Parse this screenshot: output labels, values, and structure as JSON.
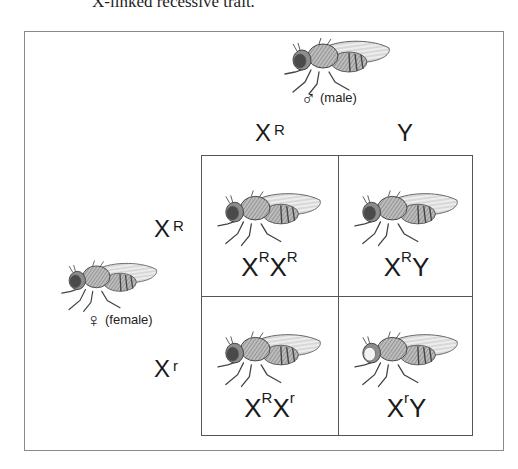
{
  "caption": "X-linked recessive trait.",
  "male_parent": {
    "symbol": "♂",
    "label": "(male)",
    "eye_color": "red"
  },
  "female_parent": {
    "symbol": "♀",
    "label": "(female)",
    "eye_color": "red"
  },
  "male_gametes": [
    {
      "base": "X",
      "sup": "R"
    },
    {
      "base": "Y",
      "sup": ""
    }
  ],
  "female_gametes": [
    {
      "base": "X",
      "sup": "R"
    },
    {
      "base": "X",
      "sup": "r"
    }
  ],
  "offspring": [
    {
      "parts": [
        {
          "base": "X",
          "sup": "R"
        },
        {
          "base": "X",
          "sup": "R"
        }
      ],
      "eye_color": "red"
    },
    {
      "parts": [
        {
          "base": "X",
          "sup": "R"
        },
        {
          "base": "Y",
          "sup": ""
        }
      ],
      "eye_color": "red"
    },
    {
      "parts": [
        {
          "base": "X",
          "sup": "R"
        },
        {
          "base": "X",
          "sup": "r"
        }
      ],
      "eye_color": "red"
    },
    {
      "parts": [
        {
          "base": "X",
          "sup": "r"
        },
        {
          "base": "Y",
          "sup": ""
        }
      ],
      "eye_color": "white"
    }
  ],
  "colors": {
    "eye_red": "#4a4a4a",
    "eye_white": "#f2f2f2"
  }
}
